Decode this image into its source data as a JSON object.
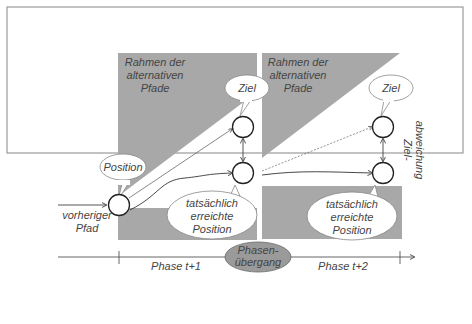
{
  "diagram": {
    "colors": {
      "frame": "#9a9a9a",
      "shade": "#a8a8a8",
      "node_stroke": "#222222",
      "text": "#444444",
      "transition_fill": "#9a9a9a"
    },
    "phase1": {
      "frame_label": [
        "Rahmen der",
        "alternativen",
        "Pfade"
      ],
      "position_bubble": "Position",
      "target_bubble": "Ziel",
      "actual_bubble": [
        "tatsächlich",
        "erreichte",
        "Position"
      ],
      "previous_path": [
        "vorheriger",
        "Pfad"
      ]
    },
    "phase2": {
      "frame_label": [
        "Rahmen der",
        "alternativen",
        "Pfade"
      ],
      "target_bubble": "Ziel",
      "actual_bubble": [
        "tatsächlich",
        "erreichte",
        "Position"
      ],
      "deviation_label": [
        "Ziel-",
        "abweichung"
      ]
    },
    "timeline": {
      "phase_t1": "Phase t+1",
      "phase_t2": "Phase t+2",
      "transition": [
        "Phasen-",
        "übergang"
      ]
    }
  }
}
